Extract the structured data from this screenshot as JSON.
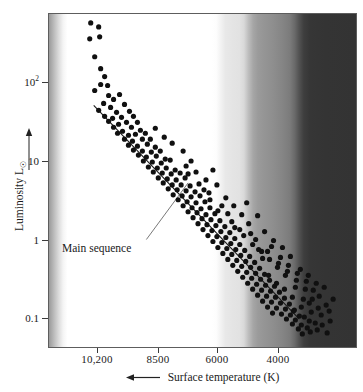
{
  "chart_data": {
    "type": "scatter",
    "title": "",
    "xlabel": "Surface temperature (K)",
    "ylabel": "Luminosity L☉",
    "x_scale": "linear-reversed",
    "y_scale": "log",
    "xlim": [
      11400,
      2800
    ],
    "ylim": [
      0.055,
      900
    ],
    "grid": false,
    "legend": "none",
    "x_ticks": [
      {
        "label": "10,200",
        "value": 10200,
        "px": 97
      },
      {
        "label": "8500",
        "value": 8500,
        "px": 158
      },
      {
        "label": "6000",
        "value": 6000,
        "px": 217
      },
      {
        "label": "4000",
        "value": 4000,
        "px": 278
      }
    ],
    "y_ticks": [
      {
        "label": "10",
        "sup": "2",
        "value": 100,
        "px": 82
      },
      {
        "label": "10",
        "sup": "",
        "value": 10,
        "px": 161
      },
      {
        "label": "1",
        "sup": "",
        "value": 1,
        "px": 240
      },
      {
        "label": "0.1",
        "sup": "",
        "value": 0.1,
        "px": 318
      }
    ],
    "annotations": [
      {
        "text": "Main sequence",
        "label_x": 62,
        "label_y": 242,
        "leader_from": [
          146,
          240
        ],
        "leader_to": [
          188,
          183
        ]
      }
    ],
    "fit_line": {
      "name": "main-sequence-fit",
      "points": [
        [
          93,
          105
        ],
        [
          300,
          320
        ]
      ],
      "color": "#1a1a1a"
    },
    "background": {
      "description": "stellar color spectrum, blue-white (hot, left) to dark red (cool, right)",
      "type": "horizontal-grayscale-gradient"
    },
    "points": [
      [
        90,
        22
      ],
      [
        98,
        26
      ],
      [
        89,
        38
      ],
      [
        99,
        36
      ],
      [
        94,
        56
      ],
      [
        100,
        68
      ],
      [
        104,
        76
      ],
      [
        100,
        84
      ],
      [
        107,
        85
      ],
      [
        94,
        90
      ],
      [
        108,
        95
      ],
      [
        113,
        99
      ],
      [
        103,
        103
      ],
      [
        119,
        94
      ],
      [
        98,
        110
      ],
      [
        110,
        107
      ],
      [
        124,
        104
      ],
      [
        116,
        112
      ],
      [
        129,
        111
      ],
      [
        104,
        116
      ],
      [
        112,
        118
      ],
      [
        121,
        117
      ],
      [
        133,
        116
      ],
      [
        108,
        121
      ],
      [
        118,
        124
      ],
      [
        126,
        122
      ],
      [
        137,
        122
      ],
      [
        113,
        127
      ],
      [
        131,
        127
      ],
      [
        122,
        131
      ],
      [
        140,
        130
      ],
      [
        117,
        133
      ],
      [
        128,
        135
      ],
      [
        135,
        134
      ],
      [
        145,
        133
      ],
      [
        124,
        139
      ],
      [
        132,
        141
      ],
      [
        142,
        139
      ],
      [
        150,
        139
      ],
      [
        128,
        145
      ],
      [
        137,
        146
      ],
      [
        147,
        144
      ],
      [
        155,
        147
      ],
      [
        133,
        150
      ],
      [
        142,
        151
      ],
      [
        151,
        152
      ],
      [
        160,
        151
      ],
      [
        138,
        155
      ],
      [
        146,
        157
      ],
      [
        156,
        156
      ],
      [
        165,
        159
      ],
      [
        143,
        161
      ],
      [
        152,
        162
      ],
      [
        161,
        163
      ],
      [
        170,
        160
      ],
      [
        148,
        167
      ],
      [
        157,
        168
      ],
      [
        166,
        168
      ],
      [
        175,
        170
      ],
      [
        153,
        172
      ],
      [
        162,
        173
      ],
      [
        171,
        174
      ],
      [
        180,
        173
      ],
      [
        158,
        178
      ],
      [
        167,
        179
      ],
      [
        176,
        180
      ],
      [
        185,
        178
      ],
      [
        163,
        183
      ],
      [
        172,
        185
      ],
      [
        181,
        185
      ],
      [
        190,
        186
      ],
      [
        168,
        189
      ],
      [
        177,
        190
      ],
      [
        186,
        191
      ],
      [
        195,
        192
      ],
      [
        173,
        195
      ],
      [
        182,
        196
      ],
      [
        191,
        197
      ],
      [
        200,
        196
      ],
      [
        178,
        200
      ],
      [
        187,
        202
      ],
      [
        196,
        203
      ],
      [
        205,
        202
      ],
      [
        183,
        206
      ],
      [
        192,
        208
      ],
      [
        201,
        209
      ],
      [
        210,
        208
      ],
      [
        188,
        212
      ],
      [
        197,
        213
      ],
      [
        206,
        215
      ],
      [
        215,
        214
      ],
      [
        193,
        218
      ],
      [
        202,
        219
      ],
      [
        211,
        220
      ],
      [
        220,
        221
      ],
      [
        198,
        224
      ],
      [
        207,
        225
      ],
      [
        216,
        226
      ],
      [
        225,
        227
      ],
      [
        203,
        230
      ],
      [
        212,
        231
      ],
      [
        221,
        232
      ],
      [
        230,
        233
      ],
      [
        208,
        236
      ],
      [
        217,
        237
      ],
      [
        226,
        238
      ],
      [
        235,
        239
      ],
      [
        213,
        242
      ],
      [
        222,
        243
      ],
      [
        231,
        244
      ],
      [
        240,
        245
      ],
      [
        218,
        248
      ],
      [
        227,
        249
      ],
      [
        236,
        250
      ],
      [
        245,
        251
      ],
      [
        223,
        254
      ],
      [
        232,
        255
      ],
      [
        241,
        256
      ],
      [
        250,
        257
      ],
      [
        228,
        260
      ],
      [
        237,
        261
      ],
      [
        246,
        262
      ],
      [
        255,
        263
      ],
      [
        233,
        266
      ],
      [
        242,
        267
      ],
      [
        251,
        268
      ],
      [
        260,
        269
      ],
      [
        238,
        272
      ],
      [
        247,
        273
      ],
      [
        256,
        274
      ],
      [
        265,
        275
      ],
      [
        243,
        278
      ],
      [
        252,
        279
      ],
      [
        261,
        280
      ],
      [
        270,
        281
      ],
      [
        248,
        284
      ],
      [
        257,
        285
      ],
      [
        266,
        286
      ],
      [
        275,
        287
      ],
      [
        253,
        290
      ],
      [
        262,
        291
      ],
      [
        271,
        292
      ],
      [
        280,
        293
      ],
      [
        258,
        296
      ],
      [
        267,
        297
      ],
      [
        276,
        298
      ],
      [
        285,
        299
      ],
      [
        263,
        302
      ],
      [
        272,
        303
      ],
      [
        281,
        304
      ],
      [
        290,
        305
      ],
      [
        268,
        308
      ],
      [
        277,
        309
      ],
      [
        286,
        310
      ],
      [
        295,
        311
      ],
      [
        273,
        314
      ],
      [
        282,
        315
      ],
      [
        291,
        316
      ],
      [
        300,
        317
      ],
      [
        287,
        320
      ],
      [
        296,
        321
      ],
      [
        305,
        318
      ],
      [
        293,
        325
      ],
      [
        302,
        326
      ],
      [
        310,
        322
      ],
      [
        299,
        330
      ],
      [
        308,
        329
      ],
      [
        316,
        324
      ],
      [
        186,
        166
      ],
      [
        191,
        161
      ],
      [
        188,
        174
      ],
      [
        196,
        172
      ],
      [
        172,
        143
      ],
      [
        183,
        151
      ],
      [
        164,
        137
      ],
      [
        155,
        128
      ],
      [
        209,
        193
      ],
      [
        217,
        185
      ],
      [
        226,
        198
      ],
      [
        234,
        206
      ],
      [
        213,
        170
      ],
      [
        242,
        215
      ],
      [
        249,
        224
      ],
      [
        258,
        216
      ],
      [
        265,
        232
      ],
      [
        274,
        241
      ],
      [
        283,
        248
      ],
      [
        291,
        257
      ],
      [
        247,
        203
      ],
      [
        256,
        240
      ],
      [
        268,
        252
      ],
      [
        279,
        264
      ],
      [
        288,
        272
      ],
      [
        297,
        281
      ],
      [
        306,
        290
      ],
      [
        313,
        300
      ],
      [
        319,
        309
      ],
      [
        312,
        313
      ],
      [
        304,
        300
      ],
      [
        296,
        288
      ],
      [
        286,
        276
      ],
      [
        278,
        268
      ],
      [
        270,
        260
      ],
      [
        262,
        252
      ],
      [
        320,
        297
      ],
      [
        327,
        306
      ],
      [
        322,
        316
      ],
      [
        330,
        312
      ],
      [
        325,
        288
      ],
      [
        317,
        284
      ],
      [
        309,
        276
      ],
      [
        301,
        270
      ],
      [
        235,
        228
      ],
      [
        244,
        236
      ],
      [
        253,
        245
      ],
      [
        228,
        214
      ],
      [
        206,
        180
      ],
      [
        199,
        184
      ],
      [
        204,
        190
      ],
      [
        222,
        206
      ],
      [
        210,
        200
      ],
      [
        218,
        211
      ],
      [
        232,
        222
      ],
      [
        240,
        230
      ],
      [
        259,
        250
      ],
      [
        251,
        234
      ],
      [
        263,
        259
      ],
      [
        272,
        247
      ],
      [
        281,
        258
      ],
      [
        289,
        266
      ],
      [
        298,
        274
      ],
      [
        307,
        282
      ],
      [
        314,
        291
      ],
      [
        323,
        326
      ],
      [
        331,
        322
      ],
      [
        334,
        300
      ],
      [
        328,
        334
      ],
      [
        318,
        331
      ],
      [
        311,
        333
      ],
      [
        303,
        335
      ],
      [
        294,
        312
      ],
      [
        302,
        308
      ],
      [
        310,
        304
      ],
      [
        293,
        298
      ],
      [
        285,
        290
      ],
      [
        277,
        284
      ],
      [
        269,
        276
      ]
    ]
  }
}
